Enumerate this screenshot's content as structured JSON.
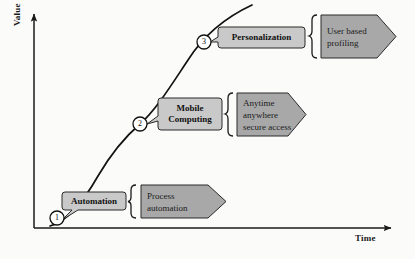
{
  "diagram": {
    "axes": {
      "y_label": "Value",
      "x_label": "Time"
    },
    "colors": {
      "callout_fill": "#c9c9c9",
      "chevron_fill": "#a8a8a8",
      "stroke": "#1a1a1a",
      "background": "#fbfbfa"
    },
    "curve": {
      "description": "S-curve rising from origin to top right",
      "points": [
        [
          55,
          221
        ],
        [
          72,
          208
        ],
        [
          95,
          183
        ],
        [
          118,
          152
        ],
        [
          140,
          124
        ],
        [
          163,
          96
        ],
        [
          186,
          64
        ],
        [
          204,
          42
        ],
        [
          222,
          26
        ],
        [
          238,
          14
        ],
        [
          252,
          5
        ]
      ]
    },
    "milestones": [
      {
        "number": "1",
        "cx": 57,
        "cy": 218,
        "callout_label": "Automation",
        "chevron_label": "Process\nautomation"
      },
      {
        "number": "2",
        "cx": 140,
        "cy": 124,
        "callout_label": "Mobile\nComputing",
        "chevron_label": "Anytime\nanywhere\nsecure access"
      },
      {
        "number": "3",
        "cx": 204,
        "cy": 42,
        "callout_label": "Personalization",
        "chevron_label": "User based\nprofiling"
      }
    ]
  }
}
